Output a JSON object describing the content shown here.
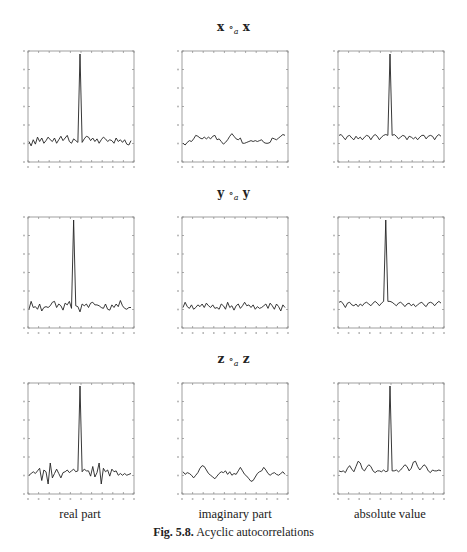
{
  "figure": {
    "caption_label": "Fig. 5.8.",
    "caption_text": "Acyclic autocorrelations"
  },
  "rows": [
    {
      "title_left": "x",
      "title_op": "∘",
      "title_sub": "a",
      "title_right": "x"
    },
    {
      "title_left": "y",
      "title_op": "∘",
      "title_sub": "a",
      "title_right": "y"
    },
    {
      "title_left": "z",
      "title_op": "∘",
      "title_sub": "a",
      "title_right": "z"
    }
  ],
  "columns": [
    {
      "label": "real part"
    },
    {
      "label": "imaginary part"
    },
    {
      "label": "absolute value"
    }
  ],
  "chart_data": [
    {
      "type": "line",
      "title": "x ∘a x — real part",
      "xlim": [
        1,
        49
      ],
      "ylim": [
        -0.2,
        1.0
      ],
      "grid": false,
      "x": [
        1,
        2,
        3,
        4,
        5,
        6,
        7,
        8,
        9,
        10,
        11,
        12,
        13,
        14,
        15,
        16,
        17,
        18,
        19,
        20,
        21,
        22,
        23,
        24,
        25,
        26,
        27,
        28,
        29,
        30,
        31,
        32,
        33,
        34,
        35,
        36,
        37,
        38,
        39,
        40,
        41,
        42,
        43,
        44,
        45,
        46,
        47,
        48,
        49
      ],
      "y": [
        0.0,
        -0.05,
        0.02,
        -0.03,
        0.05,
        0.0,
        0.04,
        -0.02,
        0.01,
        0.05,
        0.02,
        0.0,
        0.04,
        -0.02,
        0.02,
        0.06,
        0.01,
        0.04,
        0.07,
        0.0,
        -0.02,
        0.03,
        0.01,
        -0.01,
        1.0,
        -0.01,
        0.03,
        0.06,
        0.05,
        0.01,
        0.04,
        0.0,
        0.03,
        -0.02,
        0.02,
        0.05,
        0.03,
        0.0,
        0.02,
        0.01,
        -0.02,
        0.04,
        0.0,
        0.02,
        -0.01,
        0.02,
        -0.03,
        -0.04,
        0.01
      ]
    },
    {
      "type": "line",
      "title": "x ∘a x — imaginary part",
      "xlim": [
        1,
        49
      ],
      "ylim": [
        -0.2,
        1.0
      ],
      "grid": false,
      "x": [
        1,
        2,
        3,
        4,
        5,
        6,
        7,
        8,
        9,
        10,
        11,
        12,
        13,
        14,
        15,
        16,
        17,
        18,
        19,
        20,
        21,
        22,
        23,
        24,
        25,
        26,
        27,
        28,
        29,
        30,
        31,
        32,
        33,
        34,
        35,
        36,
        37,
        38,
        39,
        40,
        41,
        42,
        43,
        44,
        45,
        46,
        47,
        48,
        49
      ],
      "y": [
        -0.02,
        -0.04,
        -0.01,
        0.01,
        0.0,
        0.03,
        0.07,
        0.06,
        0.04,
        0.03,
        0.05,
        0.03,
        0.05,
        0.03,
        0.06,
        0.07,
        0.02,
        0.03,
        0.0,
        -0.03,
        -0.01,
        0.02,
        0.06,
        0.09,
        0.06,
        0.03,
        0.02,
        0.04,
        -0.02,
        -0.02,
        -0.01,
        0.0,
        0.01,
        0.0,
        0.01,
        0.0,
        0.01,
        0.02,
        -0.01,
        -0.02,
        -0.02,
        -0.01,
        0.04,
        0.03,
        0.02,
        0.04,
        0.06,
        0.08,
        0.07
      ]
    },
    {
      "type": "line",
      "title": "x ∘a x — absolute value",
      "xlim": [
        1,
        49
      ],
      "ylim": [
        -0.2,
        1.0
      ],
      "grid": false,
      "x": [
        1,
        2,
        3,
        4,
        5,
        6,
        7,
        8,
        9,
        10,
        11,
        12,
        13,
        14,
        15,
        16,
        17,
        18,
        19,
        20,
        21,
        22,
        23,
        24,
        25,
        26,
        27,
        28,
        29,
        30,
        31,
        32,
        33,
        34,
        35,
        36,
        37,
        38,
        39,
        40,
        41,
        42,
        43,
        44,
        45,
        46,
        47,
        48,
        49
      ],
      "y": [
        0.07,
        0.08,
        0.05,
        0.02,
        0.06,
        0.07,
        0.04,
        0.02,
        0.06,
        0.03,
        0.05,
        0.02,
        0.05,
        0.07,
        0.06,
        0.02,
        0.06,
        0.08,
        0.06,
        0.02,
        0.05,
        0.07,
        0.08,
        0.07,
        1.0,
        0.07,
        0.08,
        0.06,
        0.03,
        0.05,
        0.07,
        0.06,
        0.02,
        0.06,
        0.05,
        0.03,
        0.05,
        0.02,
        0.05,
        0.07,
        0.07,
        0.03,
        0.06,
        0.07,
        0.06,
        0.02,
        0.06,
        0.08,
        0.06
      ]
    },
    {
      "type": "line",
      "title": "y ∘a y — real part",
      "xlim": [
        1,
        49
      ],
      "ylim": [
        -0.2,
        1.0
      ],
      "grid": false,
      "x": [
        1,
        2,
        3,
        4,
        5,
        6,
        7,
        8,
        9,
        10,
        11,
        12,
        13,
        14,
        15,
        16,
        17,
        18,
        19,
        20,
        21,
        22,
        23,
        24,
        25,
        26,
        27,
        28,
        29,
        30,
        31,
        32,
        33,
        34,
        35,
        36,
        37,
        38,
        39,
        40,
        41,
        42,
        43,
        44,
        45,
        46,
        47,
        48,
        49
      ],
      "y": [
        -0.02,
        0.07,
        0.0,
        0.01,
        -0.02,
        0.04,
        -0.04,
        0.0,
        0.01,
        0.0,
        0.02,
        0.06,
        0.07,
        0.0,
        0.04,
        0.02,
        -0.03,
        0.05,
        0.03,
        0.07,
        -0.01,
        1.0,
        0.02,
        0.01,
        -0.05,
        0.04,
        0.02,
        0.04,
        0.0,
        0.05,
        0.06,
        0.03,
        0.03,
        0.02,
        0.0,
        -0.01,
        0.04,
        -0.02,
        -0.03,
        0.03,
        0.0,
        0.04,
        0.01,
        0.08,
        0.02,
        -0.01,
        -0.02,
        0.0,
        0.0
      ]
    },
    {
      "type": "line",
      "title": "y ∘a y — imaginary part",
      "xlim": [
        1,
        49
      ],
      "ylim": [
        -0.2,
        1.0
      ],
      "grid": false,
      "x": [
        1,
        2,
        3,
        4,
        5,
        6,
        7,
        8,
        9,
        10,
        11,
        12,
        13,
        14,
        15,
        16,
        17,
        18,
        19,
        20,
        21,
        22,
        23,
        24,
        25,
        26,
        27,
        28,
        29,
        30,
        31,
        32,
        33,
        34,
        35,
        36,
        37,
        38,
        39,
        40,
        41,
        42,
        43,
        44,
        45,
        46,
        47,
        48,
        49
      ],
      "y": [
        0.0,
        0.06,
        0.01,
        -0.01,
        0.03,
        -0.02,
        0.0,
        0.03,
        0.01,
        0.04,
        0.0,
        0.05,
        0.02,
        0.0,
        0.03,
        -0.01,
        0.0,
        -0.02,
        0.04,
        0.02,
        -0.02,
        0.06,
        0.0,
        0.02,
        -0.03,
        0.02,
        0.04,
        -0.01,
        0.02,
        0.06,
        0.02,
        0.03,
        0.0,
        0.03,
        -0.02,
        0.01,
        -0.01,
        0.0,
        0.02,
        0.04,
        -0.01,
        0.05,
        0.02,
        -0.02,
        0.04,
        0.01,
        -0.04,
        0.03,
        0.0
      ]
    },
    {
      "type": "line",
      "title": "y ∘a y — absolute value",
      "xlim": [
        1,
        49
      ],
      "ylim": [
        -0.2,
        1.0
      ],
      "grid": false,
      "x": [
        1,
        2,
        3,
        4,
        5,
        6,
        7,
        8,
        9,
        10,
        11,
        12,
        13,
        14,
        15,
        16,
        17,
        18,
        19,
        20,
        21,
        22,
        23,
        24,
        25,
        26,
        27,
        28,
        29,
        30,
        31,
        32,
        33,
        34,
        35,
        36,
        37,
        38,
        39,
        40,
        41,
        42,
        43,
        44,
        45,
        46,
        47,
        48,
        49
      ],
      "y": [
        0.06,
        0.07,
        0.04,
        0.0,
        0.05,
        0.06,
        0.03,
        0.02,
        0.04,
        0.01,
        0.04,
        0.02,
        0.05,
        0.06,
        0.04,
        0.02,
        0.05,
        0.07,
        0.05,
        0.02,
        0.05,
        0.07,
        1.0,
        0.07,
        0.07,
        0.06,
        0.04,
        0.02,
        0.05,
        0.06,
        0.04,
        0.01,
        0.04,
        0.05,
        0.02,
        0.04,
        0.01,
        0.03,
        0.05,
        0.06,
        0.03,
        0.01,
        0.05,
        0.06,
        0.05,
        0.02,
        0.05,
        0.07,
        0.05
      ]
    },
    {
      "type": "line",
      "title": "z ∘a z — real part",
      "xlim": [
        1,
        49
      ],
      "ylim": [
        -0.2,
        1.0
      ],
      "grid": false,
      "x": [
        1,
        2,
        3,
        4,
        5,
        6,
        7,
        8,
        9,
        10,
        11,
        12,
        13,
        14,
        15,
        16,
        17,
        18,
        19,
        20,
        21,
        22,
        23,
        24,
        25,
        26,
        27,
        28,
        29,
        30,
        31,
        32,
        33,
        34,
        35,
        36,
        37,
        38,
        39,
        40,
        41,
        42,
        43,
        44,
        45,
        46,
        47,
        48,
        49
      ],
      "y": [
        -0.02,
        0.0,
        0.02,
        0.0,
        0.03,
        0.06,
        -0.08,
        0.04,
        0.02,
        -0.12,
        0.12,
        -0.05,
        0.0,
        0.05,
        0.0,
        -0.05,
        0.01,
        0.02,
        0.04,
        0.01,
        0.03,
        0.05,
        0.02,
        0.03,
        1.0,
        0.02,
        0.05,
        0.03,
        0.03,
        -0.03,
        0.08,
        -0.04,
        0.01,
        0.12,
        -0.12,
        0.06,
        0.02,
        0.04,
        -0.03,
        0.05,
        0.02,
        0.03,
        -0.02,
        0.0,
        -0.02,
        0.0,
        -0.02,
        -0.01,
        0.0
      ]
    },
    {
      "type": "line",
      "title": "z ∘a z — imaginary part",
      "xlim": [
        1,
        49
      ],
      "ylim": [
        -0.2,
        1.0
      ],
      "grid": false,
      "x": [
        1,
        2,
        3,
        4,
        5,
        6,
        7,
        8,
        9,
        10,
        11,
        12,
        13,
        14,
        15,
        16,
        17,
        18,
        19,
        20,
        21,
        22,
        23,
        24,
        25,
        26,
        27,
        28,
        29,
        30,
        31,
        32,
        33,
        34,
        35,
        36,
        37,
        38,
        39,
        40,
        41,
        42,
        43,
        44,
        45,
        46,
        47,
        48,
        49
      ],
      "y": [
        0.02,
        -0.01,
        0.01,
        0.0,
        -0.02,
        -0.05,
        -0.02,
        0.01,
        0.06,
        0.09,
        0.08,
        0.04,
        0.0,
        -0.02,
        -0.04,
        -0.06,
        -0.03,
        0.0,
        0.02,
        0.01,
        0.03,
        -0.01,
        0.02,
        -0.02,
        0.0,
        -0.01,
        0.03,
        0.07,
        0.03,
        -0.01,
        -0.03,
        -0.06,
        -0.09,
        -0.08,
        -0.04,
        0.0,
        0.02,
        0.03,
        0.07,
        0.04,
        0.0,
        -0.02,
        0.0,
        0.01,
        -0.01,
        -0.02,
        0.0,
        0.02,
        -0.01
      ]
    },
    {
      "type": "line",
      "title": "z ∘a z — absolute value",
      "xlim": [
        1,
        49
      ],
      "ylim": [
        -0.2,
        1.0
      ],
      "grid": false,
      "x": [
        1,
        2,
        3,
        4,
        5,
        6,
        7,
        8,
        9,
        10,
        11,
        12,
        13,
        14,
        15,
        16,
        17,
        18,
        19,
        20,
        21,
        22,
        23,
        24,
        25,
        26,
        27,
        28,
        29,
        30,
        31,
        32,
        33,
        34,
        35,
        36,
        37,
        38,
        39,
        40,
        41,
        42,
        43,
        44,
        45,
        46,
        47,
        48,
        49
      ],
      "y": [
        0.03,
        0.02,
        0.03,
        0.01,
        0.06,
        0.09,
        0.05,
        0.02,
        0.08,
        0.14,
        0.12,
        0.05,
        0.03,
        0.07,
        0.1,
        0.08,
        0.03,
        0.01,
        0.03,
        0.03,
        0.02,
        0.04,
        0.02,
        0.03,
        1.0,
        0.03,
        0.03,
        0.04,
        0.02,
        0.04,
        0.07,
        0.1,
        0.08,
        0.03,
        0.06,
        0.13,
        0.14,
        0.08,
        0.04,
        0.07,
        0.1,
        0.08,
        0.03,
        0.01,
        0.04,
        0.03,
        0.03,
        0.04,
        0.03
      ]
    }
  ]
}
